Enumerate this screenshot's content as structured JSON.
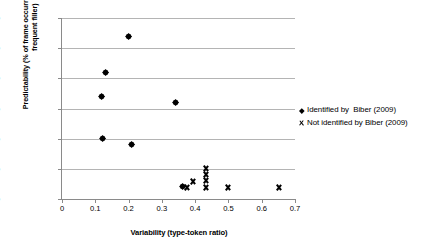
{
  "chart_data": {
    "type": "scatter",
    "title": "",
    "xlabel": "Variability (type-token ratio)",
    "ylabel": "Predictability (% of frame occurrences with most frequent filler)",
    "xlim": [
      0,
      0.7
    ],
    "ylim": [
      0,
      30
    ],
    "xticks": [
      "0",
      "0.1",
      "0.2",
      "0.3",
      "0.4",
      "0.5",
      "0.6",
      "0.7"
    ],
    "xtick_values": [
      0,
      0.1,
      0.2,
      0.3,
      0.4,
      0.5,
      0.6,
      0.7
    ],
    "yticks": [
      "0%",
      "5%",
      "10%",
      "15%",
      "20%",
      "25%",
      "30%"
    ],
    "ytick_values": [
      0,
      5,
      10,
      15,
      20,
      25,
      30
    ],
    "grid": "horizontal",
    "legend_position": "right",
    "series": [
      {
        "name": "Identified by  Biber (2009)",
        "marker": "diamond",
        "color": "#000000",
        "points": [
          {
            "x": 0.12,
            "y": 17.0
          },
          {
            "x": 0.132,
            "y": 21.0
          },
          {
            "x": 0.201,
            "y": 27.0
          },
          {
            "x": 0.122,
            "y": 10.0
          },
          {
            "x": 0.208,
            "y": 9.0
          },
          {
            "x": 0.34,
            "y": 16.0
          },
          {
            "x": 0.362,
            "y": 2.0
          }
        ]
      },
      {
        "name": "Not identified by Biber (2009)",
        "marker": "x",
        "color": "#000000",
        "points": [
          {
            "x": 0.373,
            "y": 2.0
          },
          {
            "x": 0.392,
            "y": 3.0
          },
          {
            "x": 0.432,
            "y": 5.0
          },
          {
            "x": 0.432,
            "y": 4.0
          },
          {
            "x": 0.432,
            "y": 3.1
          },
          {
            "x": 0.432,
            "y": 2.0
          },
          {
            "x": 0.497,
            "y": 2.0
          },
          {
            "x": 0.65,
            "y": 2.0
          }
        ]
      }
    ]
  },
  "axis": {
    "x_title": "Variability (type-token ratio)",
    "y_title": "Predictability (% of frame occurrences with most frequent filler)"
  },
  "legend": {
    "items": [
      {
        "label": "Identified by  Biber (2009)",
        "marker": "diamond"
      },
      {
        "label": "Not identified by Biber (2009)",
        "marker": "x"
      }
    ]
  }
}
